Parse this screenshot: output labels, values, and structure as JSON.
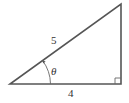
{
  "diagram": {
    "type": "right-triangle",
    "hypotenuse_label": "5",
    "base_label": "4",
    "angle_label": "θ",
    "right_angle_marker": true,
    "colors": {
      "stroke": "#555555",
      "text": "#333333",
      "background": "#ffffff"
    }
  }
}
